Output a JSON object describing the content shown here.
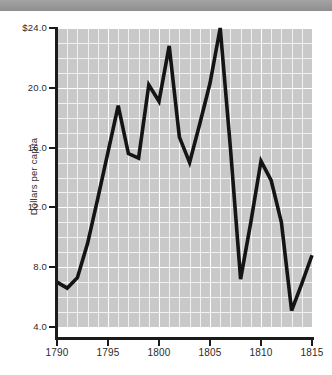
{
  "window": {
    "top_bar_color": "#9a9a9a",
    "background_color": "#ffffff"
  },
  "chart_data": {
    "type": "line",
    "title": "",
    "subtitle": "",
    "xlabel": "",
    "ylabel": "Dollars per capita",
    "xlim": [
      1790,
      1815
    ],
    "ylim": [
      4.0,
      24.0
    ],
    "grid": true,
    "legend": false,
    "legend_position": "none",
    "plot_background_color": "#c9c9c9",
    "gridline_color": "#ffffff",
    "line_color": "#141414",
    "x": [
      1790,
      1791,
      1792,
      1793,
      1794,
      1795,
      1796,
      1797,
      1798,
      1799,
      1800,
      1801,
      1802,
      1803,
      1804,
      1805,
      1806,
      1807,
      1808,
      1809,
      1810,
      1811,
      1812,
      1813,
      1814,
      1815
    ],
    "values": [
      7.0,
      6.6,
      7.3,
      9.6,
      12.6,
      15.7,
      18.8,
      15.6,
      15.3,
      20.2,
      19.1,
      22.8,
      16.7,
      15.0,
      17.6,
      20.3,
      24.0,
      16.0,
      7.2,
      11.0,
      15.1,
      13.8,
      11.0,
      5.1,
      6.9,
      8.8
    ],
    "x_ticks": [
      1790,
      1795,
      1800,
      1805,
      1810,
      1815
    ],
    "x_tick_labels": [
      "1790",
      "1795",
      "1800",
      "1805",
      "1810",
      "1815"
    ],
    "y_ticks": [
      4.0,
      8.0,
      12.0,
      16.0,
      20.0,
      24.0
    ],
    "y_tick_labels": [
      "4.0",
      "8.0",
      "12.0",
      "16.0",
      "20.0",
      "$24.0"
    ],
    "x_minor_step": 1,
    "y_minor_step": 1
  }
}
